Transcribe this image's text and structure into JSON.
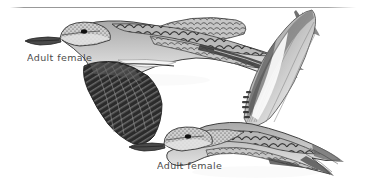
{
  "plate": {
    "background_color": "#ffffff",
    "ink_color": "#2f2f2f",
    "width": 368,
    "height": 192,
    "divider": {
      "name": "top-rule",
      "color": "#8e8e8e"
    }
  },
  "figures": [
    {
      "id": "upper-bird",
      "caption": "Adult female",
      "pose": "flying-left-wing-down",
      "caption_position": {
        "x": 27,
        "y": 52
      }
    },
    {
      "id": "lower-bird",
      "caption": "Adult female",
      "pose": "flying-left-wing-up",
      "caption_position": {
        "x": 157,
        "y": 160
      }
    }
  ],
  "labels": {
    "upper": "Adult female",
    "lower": "Adult female"
  }
}
